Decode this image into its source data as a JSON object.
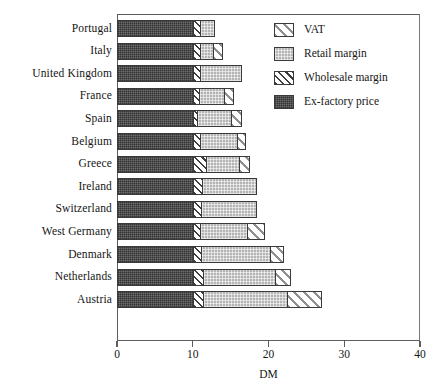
{
  "chart_data": {
    "type": "bar",
    "orientation": "horizontal",
    "stacked": true,
    "title": "",
    "xlabel": "DM",
    "ylabel": "",
    "xlim": [
      0,
      40
    ],
    "xticks": [
      0,
      10,
      20,
      30,
      40
    ],
    "xtick_labels": [
      "0",
      "10",
      "20",
      "30",
      "40"
    ],
    "grid": false,
    "legend_position": "top-right",
    "categories": [
      "Portugal",
      "Italy",
      "United Kingdom",
      "France",
      "Spain",
      "Belgium",
      "Greece",
      "Ireland",
      "Switzerland",
      "West Germany",
      "Denmark",
      "Netherlands",
      "Austria"
    ],
    "series": [
      {
        "name": "Ex-factory price",
        "key": "exfactory",
        "pattern": "dark-gray-stipple",
        "color": "#6e6e6e",
        "values": [
          10.0,
          10.0,
          10.0,
          10.0,
          10.0,
          10.0,
          10.0,
          10.0,
          10.0,
          10.0,
          10.0,
          10.0,
          10.0
        ]
      },
      {
        "name": "Wholesale margin",
        "key": "wholesale",
        "pattern": "dense-diagonal-hatch",
        "color": "#3d3d3d",
        "values": [
          0.9,
          0.9,
          1.0,
          0.8,
          0.6,
          1.0,
          1.7,
          1.2,
          1.1,
          1.0,
          1.1,
          1.3,
          1.4
        ]
      },
      {
        "name": "Retail margin",
        "key": "retail",
        "pattern": "light-gray-stipple",
        "color": "#b4b4b4",
        "values": [
          2.1,
          1.8,
          5.5,
          3.3,
          4.5,
          4.8,
          4.4,
          7.3,
          7.4,
          6.2,
          9.1,
          9.6,
          11.0
        ]
      },
      {
        "name": "VAT",
        "key": "vat",
        "pattern": "wide-diagonal-hatch",
        "color": "#8f8f8f",
        "values": [
          0.0,
          1.3,
          0.0,
          1.4,
          1.4,
          1.2,
          1.4,
          0.0,
          0.0,
          2.3,
          1.8,
          2.1,
          4.6
        ]
      }
    ],
    "totals": [
      13.0,
      14.0,
      16.5,
      15.5,
      16.5,
      17.0,
      17.5,
      18.5,
      18.5,
      19.5,
      22.0,
      23.0,
      27.0
    ]
  },
  "legend": {
    "items": [
      {
        "label": "VAT",
        "key": "vat"
      },
      {
        "label": "Retail margin",
        "key": "retail"
      },
      {
        "label": "Wholesale margin",
        "key": "wholesale"
      },
      {
        "label": "Ex-factory price",
        "key": "exfactory"
      }
    ]
  },
  "axis": {
    "x_title": "DM"
  }
}
